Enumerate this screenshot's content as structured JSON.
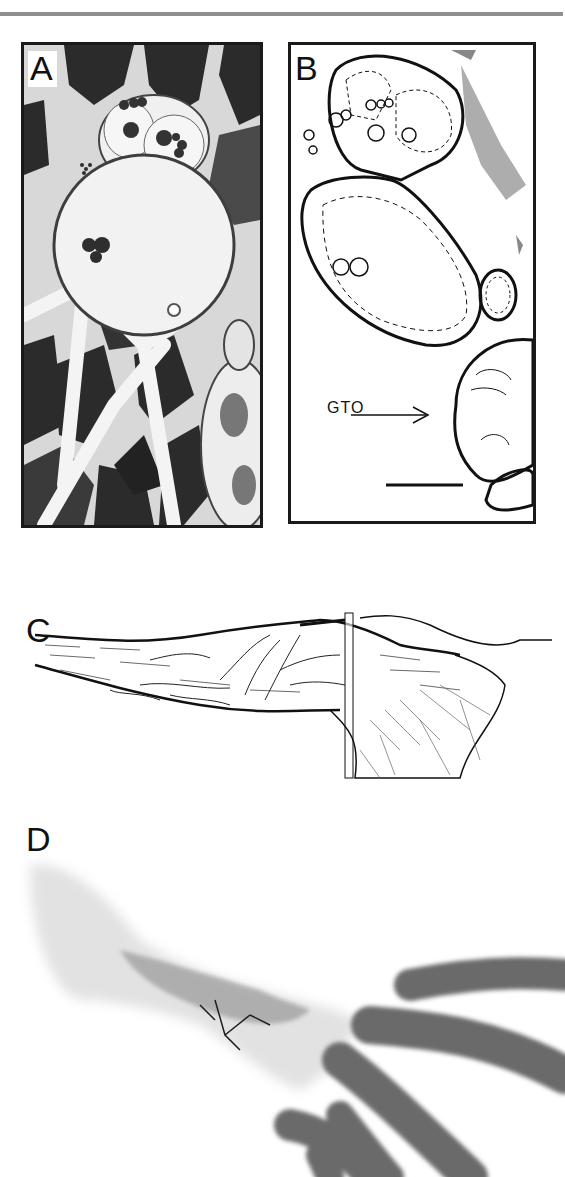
{
  "page": {
    "header_text": "",
    "header_rule_color": "#8f8f8f"
  },
  "figure": {
    "panels": [
      {
        "id": "A",
        "label": "A",
        "type": "photomicrograph",
        "description": "Light micrograph cross-section of muscle with encapsulated receptor"
      },
      {
        "id": "B",
        "label": "B",
        "type": "line-drawing",
        "description": "Tracing of panel A outlining capsules",
        "annotations": [
          {
            "text": "GTO",
            "arrow": "right"
          }
        ],
        "scale_bar": true
      },
      {
        "id": "C",
        "label": "C",
        "type": "line-drawing",
        "description": "Drawing of Golgi tendon organ with afferent axon branching; vertical rectangle marks section plane"
      },
      {
        "id": "D",
        "label": "D",
        "type": "photomicrograph",
        "description": "Whole-mount stained tendon organ with muscle fibers inserting"
      }
    ]
  },
  "colors": {
    "ink": "#111111",
    "frame": "#1a1a1a",
    "muscle_dark": "#2a2a2a",
    "muscle_mid": "#555555",
    "tissue_light": "#e8e8e8",
    "fiber_gray": "#6e6e6e"
  }
}
